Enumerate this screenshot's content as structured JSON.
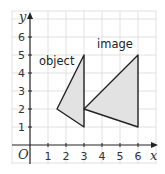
{
  "diagram": {
    "type": "coordinate-grid-transformation",
    "axes": {
      "x_label": "x",
      "y_label": "y",
      "origin_label": "O",
      "x_ticks": [
        "1",
        "2",
        "3",
        "4",
        "5",
        "6"
      ],
      "y_ticks": [
        "1",
        "2",
        "3",
        "4",
        "5",
        "6"
      ]
    },
    "shapes": [
      {
        "name": "object",
        "label": "object",
        "vertices": [
          [
            1.5,
            2
          ],
          [
            3,
            5
          ],
          [
            3,
            1
          ]
        ]
      },
      {
        "name": "image",
        "label": "image",
        "vertices": [
          [
            3,
            2
          ],
          [
            6,
            5
          ],
          [
            6,
            1
          ]
        ]
      }
    ],
    "colors": {
      "fill": "#e2e2e2",
      "stroke": "#222222",
      "grid": "#d9d9d9"
    }
  }
}
